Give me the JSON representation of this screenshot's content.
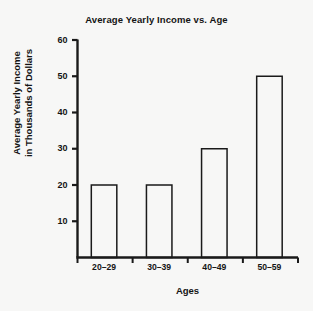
{
  "chart_data": {
    "type": "bar",
    "title": "Average Yearly Income vs. Age",
    "xlabel": "Ages",
    "ylabel": "Average Yearly Income in Thousands of Dollars",
    "ylabel_lines": [
      "Average Yearly Income",
      "in Thousands of Dollars"
    ],
    "categories": [
      "20–29",
      "30–39",
      "40–49",
      "50–59"
    ],
    "values": [
      20,
      20,
      30,
      50
    ],
    "ylim": [
      0,
      60
    ],
    "ytick_labels": [
      "10",
      "20",
      "30",
      "40",
      "50",
      "60"
    ],
    "ytick_values": [
      10,
      20,
      30,
      40,
      50,
      60
    ],
    "grid": false,
    "legend": null,
    "bar_fill_color": "#f7f7f6",
    "bar_edge_color": "#1a1a1a",
    "axis_color": "#1a1a1a",
    "background_color": "#f7f7f6"
  }
}
